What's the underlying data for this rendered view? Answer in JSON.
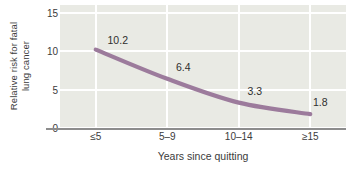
{
  "chart_data": {
    "type": "line",
    "title": "",
    "xlabel": "Years since quitting",
    "ylabel_line1": "Relative risk for fatal",
    "ylabel_line2": "lung cancer",
    "categories": [
      "≤5",
      "5–9",
      "10–14",
      "≥15"
    ],
    "values": [
      10.2,
      6.4,
      3.3,
      1.8
    ],
    "point_labels": [
      "10.2",
      "6.4",
      "3.3",
      "1.8"
    ],
    "ytick_labels": [
      "0",
      "5",
      "10",
      "15"
    ],
    "ytick_values": [
      0,
      5,
      10,
      15
    ],
    "ylim": [
      0,
      16
    ],
    "grid": "white horizontal and vertical gridlines",
    "legend": "none",
    "series": [
      {
        "name": "Relative risk for fatal lung cancer",
        "values": [
          10.2,
          6.4,
          3.3,
          1.8
        ]
      }
    ]
  },
  "style": {
    "line_color": "#9c7b9c",
    "plot_background": "#e9eae4",
    "grid_color": "#ffffff",
    "axis_color": "#8d8d8d",
    "text_color": "#3b3b3b",
    "page_background": "#ffffff"
  }
}
